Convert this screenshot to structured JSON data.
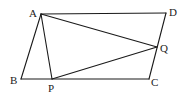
{
  "diagram": {
    "type": "geometry",
    "stroke_color": "#1a1a1a",
    "points": {
      "A": {
        "label": "A",
        "x": 41,
        "y": 14,
        "lx": 29,
        "ly": 17
      },
      "B": {
        "label": "B",
        "x": 21,
        "y": 79,
        "lx": 10,
        "ly": 84
      },
      "C": {
        "label": "C",
        "x": 149,
        "y": 79,
        "lx": 151,
        "ly": 86
      },
      "D": {
        "label": "D",
        "x": 166,
        "y": 13,
        "lx": 169,
        "ly": 16
      },
      "P": {
        "label": "P",
        "x": 52,
        "y": 79,
        "lx": 48,
        "ly": 92
      },
      "Q": {
        "label": "Q",
        "x": 157,
        "y": 47,
        "lx": 160,
        "ly": 52
      }
    },
    "segments": [
      [
        "A",
        "D"
      ],
      [
        "D",
        "C"
      ],
      [
        "C",
        "B"
      ],
      [
        "B",
        "A"
      ],
      [
        "A",
        "P"
      ],
      [
        "A",
        "Q"
      ],
      [
        "P",
        "Q"
      ]
    ]
  }
}
